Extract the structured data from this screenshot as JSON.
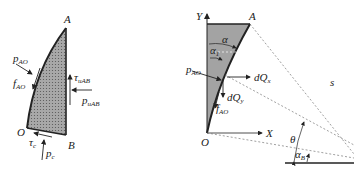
{
  "figure_left": {
    "points": {
      "A": "A",
      "B": "B",
      "O": "O"
    },
    "forces": {
      "p_AO": {
        "main": "p",
        "sub": "AO"
      },
      "f_AO": {
        "main": "f",
        "sub": "AO"
      },
      "tau_uAB": {
        "main": "τ",
        "sub": "uAB"
      },
      "p_uAB": {
        "main": "p",
        "sub": "uAB"
      },
      "tau_c": {
        "main": "τ",
        "sub": "c"
      },
      "p_c": {
        "main": "p",
        "sub": "c"
      }
    }
  },
  "figure_right": {
    "axes": {
      "x": "X",
      "y": "Y"
    },
    "points": {
      "A": "A",
      "O": "O"
    },
    "angles": {
      "alpha": {
        "main": "α",
        "sub": ""
      },
      "alpha_1": {
        "main": "α",
        "sub": "1"
      },
      "theta": {
        "main": "θ",
        "sub": ""
      },
      "alpha_B": {
        "main": "α",
        "sub": "B"
      }
    },
    "forces": {
      "p_AO": {
        "main": "p",
        "sub": "AO"
      },
      "f_AO": {
        "main": "f",
        "sub": "AO"
      },
      "dQx": {
        "main": "dQ",
        "sub": "x"
      },
      "dQy": {
        "main": "dQ",
        "sub": "y"
      }
    },
    "length": "s"
  },
  "colors": {
    "fill": "#9a9a9a",
    "line": "#222222",
    "dash": "#777777"
  }
}
